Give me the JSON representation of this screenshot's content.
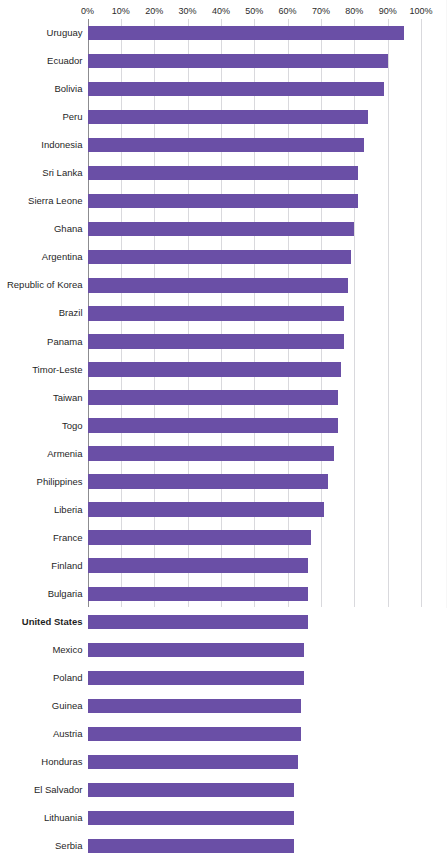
{
  "chart_data": {
    "type": "bar",
    "orientation": "horizontal",
    "title": "",
    "xlabel": "",
    "ylabel": "",
    "xlim": [
      0,
      100
    ],
    "grid": true,
    "legend": "none",
    "bar_color": "#6a4fa6",
    "highlight_label": "United States",
    "xticks": [
      "0%",
      "10%",
      "20%",
      "30%",
      "40%",
      "50%",
      "60%",
      "70%",
      "80%",
      "90%",
      "100%"
    ],
    "xtick_values": [
      0,
      10,
      20,
      30,
      40,
      50,
      60,
      70,
      80,
      90,
      100
    ],
    "categories": [
      "Uruguay",
      "Ecuador",
      "Bolivia",
      "Peru",
      "Indonesia",
      "Sri Lanka",
      "Sierra Leone",
      "Ghana",
      "Argentina",
      "Republic of Korea",
      "Brazil",
      "Panama",
      "Timor-Leste",
      "Taiwan",
      "Togo",
      "Armenia",
      "Philippines",
      "Liberia",
      "France",
      "Finland",
      "Bulgaria",
      "United States",
      "Mexico",
      "Poland",
      "Guinea",
      "Austria",
      "Honduras",
      "El Salvador",
      "Lithuania",
      "Serbia"
    ],
    "values": [
      95,
      90,
      89,
      84,
      83,
      81,
      81,
      80,
      79,
      78,
      77,
      77,
      76,
      75,
      75,
      74,
      72,
      71,
      67,
      66,
      66,
      66,
      65,
      65,
      64,
      64,
      63,
      62,
      62,
      62
    ]
  }
}
